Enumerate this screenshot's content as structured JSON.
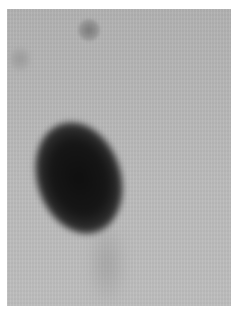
{
  "image": {
    "kind": "grayscale blot / autoradiograph",
    "background_color": "#b9b9b9",
    "border_color": "#ffffff",
    "spots": [
      {
        "id": "main",
        "description": "large dark oval spot",
        "color": "#111111"
      },
      {
        "id": "top",
        "description": "small faint spot near top",
        "color": "#7a7a7a"
      },
      {
        "id": "left",
        "description": "faint spot on upper-left edge",
        "color": "#9a9a9a"
      }
    ]
  }
}
